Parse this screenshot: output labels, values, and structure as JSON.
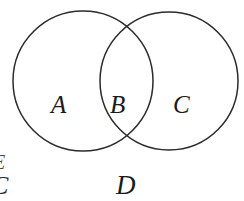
{
  "diagram": {
    "type": "venn",
    "title": "",
    "background_color": "#ffffff",
    "stroke_color": "#2b2b2b",
    "stroke_width": 1.5,
    "fill": "none",
    "circles": [
      {
        "id": "left-circle",
        "label": "A",
        "cx": 83,
        "cy": 81,
        "r": 70
      },
      {
        "id": "right-circle",
        "label": "C",
        "cx": 169,
        "cy": 81,
        "r": 69
      }
    ],
    "regions": [
      {
        "id": "region-a",
        "label": "A",
        "description": "left circle only"
      },
      {
        "id": "region-b",
        "label": "B",
        "description": "intersection of both circles"
      },
      {
        "id": "region-c",
        "label": "C",
        "description": "right circle only"
      }
    ],
    "labels": {
      "a": "A",
      "b": "B",
      "c": "C",
      "d": "D"
    },
    "edge_fragments": {
      "cropped_c": "C",
      "cropped_mark": "E"
    }
  }
}
